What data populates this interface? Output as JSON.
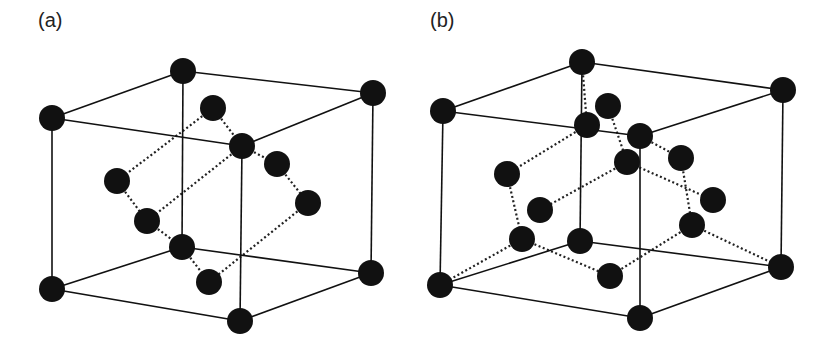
{
  "figure": {
    "panels": [
      {
        "label": "(a)",
        "label_pos": [
          38,
          9
        ],
        "atom_radius": 13,
        "cube_vertices": {
          "back_top_left": [
            183,
            71
          ],
          "back_top_right": [
            373,
            93
          ],
          "front_top_left": [
            52,
            118
          ],
          "front_top_right": [
            242,
            146
          ],
          "back_bottom_left": [
            182,
            247
          ],
          "back_bottom_right": [
            371,
            273
          ],
          "front_bottom_left": [
            52,
            289
          ],
          "front_bottom_right": [
            240,
            321
          ]
        },
        "cube_edges": [
          [
            "front_top_left",
            "back_top_left"
          ],
          [
            "back_top_left",
            "back_top_right"
          ],
          [
            "front_top_left",
            "front_top_right"
          ],
          [
            "front_top_right",
            "back_top_right"
          ],
          [
            "front_top_left",
            "front_bottom_left"
          ],
          [
            "front_top_right",
            "front_bottom_right"
          ],
          [
            "back_top_right",
            "back_bottom_right"
          ],
          [
            "back_top_left",
            "back_bottom_left"
          ],
          [
            "front_bottom_left",
            "front_bottom_right"
          ],
          [
            "front_bottom_right",
            "back_bottom_right"
          ],
          [
            "front_bottom_left",
            "back_bottom_left"
          ],
          [
            "back_bottom_left",
            "back_bottom_right"
          ]
        ],
        "inner_atoms": [
          [
            213,
            108
          ],
          [
            117,
            181
          ],
          [
            147,
            221
          ],
          [
            277,
            164
          ],
          [
            308,
            203
          ],
          [
            209,
            282
          ]
        ],
        "dotted_bonds": [
          [
            [
              213,
              108
            ],
            [
              117,
              181
            ]
          ],
          [
            [
              213,
              108
            ],
            [
              242,
              146
            ]
          ],
          [
            [
              242,
              146
            ],
            [
              147,
              221
            ]
          ],
          [
            [
              242,
              146
            ],
            [
              277,
              164
            ]
          ],
          [
            [
              277,
              164
            ],
            [
              308,
              203
            ]
          ],
          [
            [
              308,
              203
            ],
            [
              209,
              282
            ]
          ],
          [
            [
              117,
              181
            ],
            [
              147,
              221
            ]
          ],
          [
            [
              147,
              221
            ],
            [
              182,
              247
            ]
          ],
          [
            [
              182,
              247
            ],
            [
              209,
              282
            ]
          ]
        ]
      },
      {
        "label": "(b)",
        "label_pos": [
          430,
          9
        ],
        "atom_radius": 13,
        "cube_vertices": {
          "back_top_left": [
            582,
            62
          ],
          "back_top_right": [
            783,
            90
          ],
          "front_top_left": [
            443,
            111
          ],
          "front_top_right": [
            640,
            136
          ],
          "back_bottom_left": [
            580,
            241
          ],
          "back_bottom_right": [
            781,
            267
          ],
          "front_bottom_left": [
            440,
            285
          ],
          "front_bottom_right": [
            640,
            318
          ]
        },
        "cube_edges": [
          [
            "front_top_left",
            "back_top_left"
          ],
          [
            "back_top_left",
            "back_top_right"
          ],
          [
            "front_top_left",
            "front_top_right"
          ],
          [
            "front_top_right",
            "back_top_right"
          ],
          [
            "front_top_left",
            "front_bottom_left"
          ],
          [
            "front_top_right",
            "front_bottom_right"
          ],
          [
            "back_top_right",
            "back_bottom_right"
          ],
          [
            "back_top_left",
            "back_bottom_left"
          ],
          [
            "front_bottom_left",
            "front_bottom_right"
          ],
          [
            "front_bottom_right",
            "back_bottom_right"
          ],
          [
            "front_bottom_left",
            "back_bottom_left"
          ],
          [
            "back_bottom_left",
            "back_bottom_right"
          ]
        ],
        "inner_atoms": [
          [
            608,
            106
          ],
          [
            587,
            125
          ],
          [
            507,
            174
          ],
          [
            627,
            162
          ],
          [
            681,
            158
          ],
          [
            540,
            210
          ],
          [
            713,
            200
          ],
          [
            522,
            239
          ],
          [
            692,
            225
          ],
          [
            610,
            276
          ]
        ],
        "dotted_bonds": [
          [
            [
              582,
              62
            ],
            [
              587,
              125
            ]
          ],
          [
            [
              587,
              125
            ],
            [
              507,
              174
            ]
          ],
          [
            [
              608,
              106
            ],
            [
              627,
              162
            ]
          ],
          [
            [
              627,
              162
            ],
            [
              540,
              210
            ]
          ],
          [
            [
              627,
              162
            ],
            [
              713,
              200
            ]
          ],
          [
            [
              681,
              158
            ],
            [
              640,
              136
            ]
          ],
          [
            [
              681,
              158
            ],
            [
              692,
              225
            ]
          ],
          [
            [
              507,
              174
            ],
            [
              522,
              239
            ]
          ],
          [
            [
              522,
              239
            ],
            [
              440,
              285
            ]
          ],
          [
            [
              522,
              239
            ],
            [
              610,
              276
            ]
          ],
          [
            [
              610,
              276
            ],
            [
              692,
              225
            ]
          ],
          [
            [
              692,
              225
            ],
            [
              781,
              267
            ]
          ]
        ]
      }
    ]
  }
}
